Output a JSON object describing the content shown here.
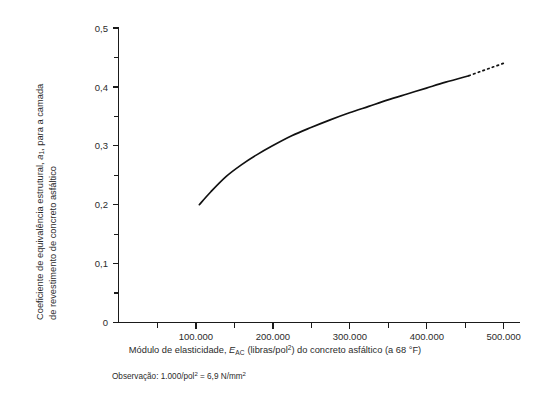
{
  "chart_data": {
    "type": "line",
    "title": "",
    "xlabel": "Módulo de elasticidade, E_AC (libras/pol²) do concreto asfáltico (a 68 °F)",
    "ylabel": "Coeficiente de equivalência estrutural, a₁, para a camada de revestimento de concreto asfáltico",
    "xlim": [
      0,
      520000
    ],
    "ylim": [
      0,
      0.5
    ],
    "grid": false,
    "legend_position": "none",
    "x_major_ticks": [
      100000,
      200000,
      300000,
      400000,
      500000
    ],
    "x_major_tick_labels": [
      "100.000",
      "200.000",
      "300.000",
      "400.000",
      "500.000"
    ],
    "x_minor_ticks": [
      50000,
      150000,
      250000,
      350000,
      450000
    ],
    "y_major_ticks": [
      0,
      0.1,
      0.2,
      0.3,
      0.4,
      0.5
    ],
    "y_major_tick_labels": [
      "0",
      "0,1",
      "0,2",
      "0,3",
      "0,4",
      "0,5"
    ],
    "y_minor_ticks": [
      0.05,
      0.15,
      0.25,
      0.35,
      0.45
    ],
    "series": [
      {
        "name": "Coeficiente a1 (trecho medido)",
        "style": "solid",
        "x": [
          105000,
          120000,
          140000,
          160000,
          180000,
          200000,
          225000,
          250000,
          275000,
          300000,
          325000,
          350000,
          375000,
          400000,
          425000,
          455000
        ],
        "values": [
          0.2,
          0.222,
          0.248,
          0.268,
          0.285,
          0.3,
          0.317,
          0.331,
          0.344,
          0.356,
          0.367,
          0.378,
          0.388,
          0.398,
          0.408,
          0.419
        ]
      },
      {
        "name": "Coeficiente a1 (extrapolação)",
        "style": "dotted",
        "x": [
          455000,
          470000,
          485000,
          500000
        ],
        "values": [
          0.419,
          0.426,
          0.433,
          0.44
        ]
      }
    ]
  },
  "axes": {
    "y_title_line1": "Coeficiente de equivalência  estrutural, ",
    "y_title_line1_symbol": "a",
    "y_title_line1_subscript": "1",
    "y_title_line1_tail": ", para a camada",
    "y_title_line2": "de revestimento de concreto asfáltico",
    "x_title_part1": "Módulo de elasticidade, ",
    "x_title_symbol": "E",
    "x_title_subscript": "AC",
    "x_title_part2": " (libras/pol",
    "x_title_superscript": "2",
    "x_title_part3": ") do concreto asfáltico (a 68 °F)"
  },
  "footnote": {
    "prefix": "Observação: 1.000/pol",
    "sup1": "2",
    "middle": " = 6,9 N/mm",
    "sup2": "2"
  }
}
